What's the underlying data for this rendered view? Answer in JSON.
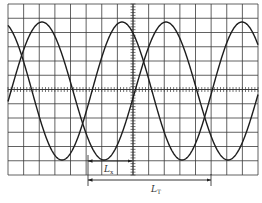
{
  "diagram": {
    "type": "oscilloscope-trace",
    "grid": {
      "left": 8,
      "top": 4,
      "right": 258,
      "bottom": 175,
      "cols": 16,
      "rows": 12,
      "center_x": 133,
      "center_y": 89.5
    },
    "colors": {
      "grid": "#3a3a3a",
      "trace": "#1e1e1e",
      "background": "#ffffff"
    },
    "traces": [
      {
        "name": "trace-a",
        "peak_x": 42,
        "period_px": 124,
        "amplitude_px": 69,
        "center_y": 91
      },
      {
        "name": "trace-b",
        "peak_x": 122,
        "period_px": 120,
        "amplitude_px": 69,
        "center_y": 91
      }
    ],
    "measurements": [
      {
        "name": "Lx",
        "label_main": "L",
        "label_sub": "x",
        "x1": 88,
        "x2": 132,
        "y": 161,
        "label_x": 104,
        "label_y": 172
      },
      {
        "name": "LT",
        "label_main": "L",
        "label_sub": "T",
        "x1": 88,
        "x2": 211,
        "y": 180,
        "label_x": 151,
        "label_y": 192
      }
    ]
  }
}
